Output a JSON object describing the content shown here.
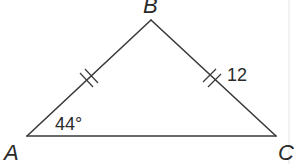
{
  "diagram": {
    "type": "isosceles-triangle",
    "vertices": {
      "A": {
        "label": "A",
        "x": 27,
        "y": 136
      },
      "B": {
        "label": "B",
        "x": 151,
        "y": 20
      },
      "C": {
        "label": "C",
        "x": 276,
        "y": 136
      }
    },
    "angle_A": {
      "label": "44°",
      "value": 44
    },
    "side_BC": {
      "label": "12",
      "value": 12
    },
    "congruent_sides": [
      "AB",
      "BC"
    ],
    "tick_marks": 2,
    "colors": {
      "stroke": "#3a3a3a",
      "text": "#2a2a2a",
      "background": "#ffffff"
    }
  }
}
